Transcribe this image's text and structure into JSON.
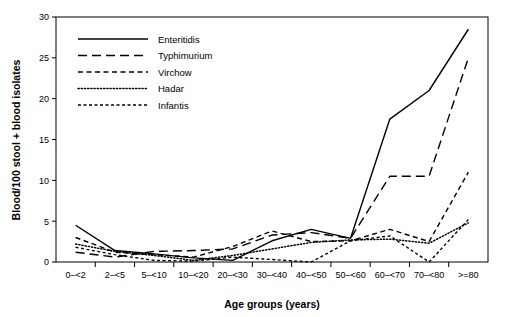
{
  "chart_data": {
    "type": "line",
    "title": "",
    "xlabel": "Age groups (years)",
    "ylabel": "Blood/100 stool + blood isolates",
    "categories": [
      "0–<2",
      "2–<5",
      "5–<10",
      "10–<20",
      "20–<30",
      "30–<40",
      "40–<50",
      "50–<60",
      "60–<70",
      "70–<80",
      ">=80"
    ],
    "ylim": [
      0,
      30
    ],
    "yticks": [
      0,
      5,
      10,
      15,
      20,
      25,
      30
    ],
    "yticklabels": [
      "0",
      "5",
      "10",
      "15",
      "20",
      "25",
      "30"
    ],
    "grid": false,
    "legend_position": "top-left",
    "series": [
      {
        "name": "Enteritidis",
        "dash": "solid",
        "color": "#000000",
        "values": [
          4.5,
          1.4,
          1.0,
          0.5,
          0.2,
          2.6,
          4.0,
          2.9,
          17.5,
          21.0,
          28.5
        ]
      },
      {
        "name": "Typhimurium",
        "dash": "long-dash",
        "color": "#000000",
        "values": [
          1.2,
          0.6,
          1.3,
          1.4,
          1.6,
          3.3,
          3.6,
          2.9,
          10.5,
          10.5,
          25.0
        ]
      },
      {
        "name": "Virchow",
        "dash": "medium-dash",
        "color": "#000000",
        "values": [
          3.0,
          1.2,
          0.9,
          0.6,
          1.9,
          3.8,
          2.5,
          2.6,
          4.0,
          2.5,
          11.0
        ]
      },
      {
        "name": "Hadar",
        "dash": "dotted",
        "color": "#000000",
        "values": [
          2.2,
          1.3,
          0.8,
          0.2,
          0.8,
          1.6,
          2.4,
          2.7,
          2.8,
          2.3,
          4.8
        ]
      },
      {
        "name": "Infantis",
        "dash": "short-dash",
        "color": "#000000",
        "values": [
          1.8,
          0.9,
          0.2,
          0.1,
          0.6,
          0.3,
          0.0,
          2.6,
          3.2,
          0.0,
          5.2
        ]
      }
    ]
  },
  "axes": {
    "y_title": "Blood/100 stool + blood isolates",
    "x_title": "Age groups (years)",
    "y_ticks": [
      "30",
      "25",
      "20",
      "15",
      "10",
      "5",
      "0"
    ],
    "x_ticks": [
      "0–<2",
      "2–<5",
      "5–<10",
      "10–<20",
      "20–<30",
      "30–<40",
      "40–<50",
      "50–<60",
      "60–<70",
      "70–<80",
      ">=80"
    ]
  },
  "legend": {
    "items": [
      {
        "label": "Enteritidis",
        "style": "solid"
      },
      {
        "label": "Typhimurium",
        "style": "long-dash"
      },
      {
        "label": "Virchow",
        "style": "medium-dash"
      },
      {
        "label": "Hadar",
        "style": "dotted"
      },
      {
        "label": "Infantis",
        "style": "short-dash"
      }
    ]
  }
}
